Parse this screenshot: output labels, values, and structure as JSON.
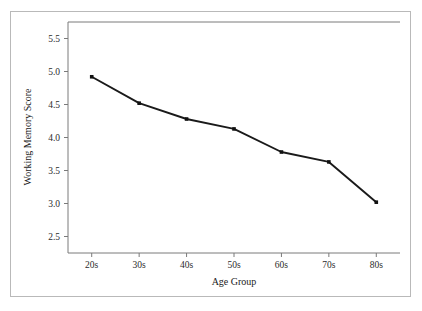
{
  "chart_data": {
    "type": "line",
    "title": "",
    "xlabel": "Age Group",
    "ylabel": "Working Memory Score",
    "categories": [
      "20s",
      "30s",
      "40s",
      "50s",
      "60s",
      "70s",
      "80s"
    ],
    "values": [
      4.92,
      4.52,
      4.28,
      4.13,
      3.78,
      3.63,
      3.02
    ],
    "series": [
      {
        "name": "Working Memory Score",
        "values": [
          4.92,
          4.52,
          4.28,
          4.13,
          3.78,
          3.63,
          3.02
        ]
      }
    ],
    "yticks": [
      "2.5",
      "3.0",
      "3.5",
      "4.0",
      "4.5",
      "5.0",
      "5.5"
    ],
    "ytick_values": [
      2.5,
      3.0,
      3.5,
      4.0,
      4.5,
      5.0,
      5.5
    ],
    "xticks": [
      "20s",
      "30s",
      "40s",
      "50s",
      "60s",
      "70s",
      "80s"
    ],
    "ylim": [
      2.25,
      5.75
    ],
    "grid": false,
    "legend": false,
    "legend_position": "none",
    "marker": "square",
    "line_color": "#1a1a1a",
    "axis_color": "#7a7a7a",
    "frame_color": "#b9b9b9",
    "background_color": "#ffffff"
  }
}
